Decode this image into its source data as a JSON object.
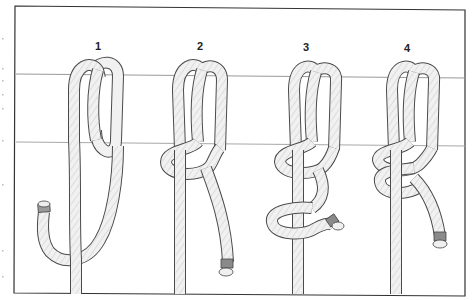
{
  "figure": {
    "steps": [
      {
        "number": "1",
        "x": 98,
        "description": "Rope passed over bar, working end hangs down and curls up to the left"
      },
      {
        "number": "2",
        "x": 200,
        "description": "Working end wraps around standing part forming first half hitch"
      },
      {
        "number": "3",
        "x": 306,
        "description": "Second turn made below, forming loop around standing part"
      },
      {
        "number": "4",
        "x": 407,
        "description": "Knot tightened, working end trails to the right"
      }
    ],
    "bar": {
      "top_y": 74,
      "bottom_y": 142
    },
    "frame": {
      "left": 15,
      "top": 6,
      "right": 465,
      "bottom": 294
    }
  },
  "colors": {
    "background": "#ffffff",
    "frame": "#333333",
    "bar_line": "#9a9a9a",
    "rope_fill": "#f1f1f1",
    "rope_outline": "#4a4a4a",
    "rope_hatch": "#bdbdbd",
    "whipping": "#8a8a8a"
  }
}
